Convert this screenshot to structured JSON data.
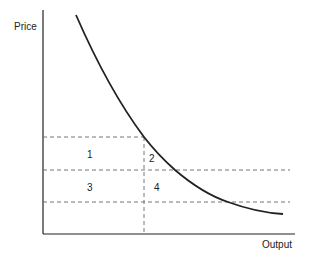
{
  "diagram": {
    "type": "demand-curve-revenue-areas",
    "axes": {
      "y_label": "Price",
      "x_label": "Output"
    },
    "regions": [
      {
        "id": "1",
        "label": "1"
      },
      {
        "id": "2",
        "label": "2"
      },
      {
        "id": "3",
        "label": "3"
      },
      {
        "id": "4",
        "label": "4"
      }
    ],
    "colors": {
      "line": "#222222",
      "dashed": "#666666"
    }
  }
}
